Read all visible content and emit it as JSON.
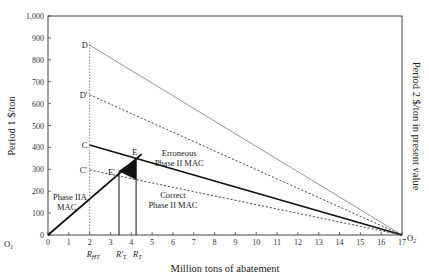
{
  "chart_data": {
    "type": "line",
    "title": "",
    "xlabel": "Million tons of abatement",
    "ylabel_left": "Period 1 $/ton",
    "ylabel_right": "Period 2 $/ton in present value",
    "xlim": [
      0,
      17
    ],
    "ylim": [
      0,
      1000
    ],
    "x_ticks": [
      "0",
      "1",
      "2",
      "3",
      "4",
      "5",
      "6",
      "7",
      "8",
      "9",
      "10",
      "11",
      "12",
      "13",
      "14",
      "15",
      "16",
      "17"
    ],
    "y_ticks": [
      "0",
      "100",
      "200",
      "300",
      "400",
      "500",
      "600",
      "700",
      "800",
      "900",
      "1,000"
    ],
    "grid": false,
    "origin_labels": {
      "left": "O1",
      "right": "O2"
    },
    "x_markers": [
      {
        "label": "R_HT",
        "x": 2.0
      },
      {
        "label": "R'_T",
        "x": 3.41
      },
      {
        "label": "R_T",
        "x": 4.23
      }
    ],
    "series": [
      {
        "name": "D line (Period 2 MAC, high)",
        "style": "solid-thin-gray",
        "points": [
          [
            2,
            867
          ],
          [
            17,
            0
          ]
        ]
      },
      {
        "name": "D' line",
        "style": "dotted",
        "points": [
          [
            2,
            640
          ],
          [
            17,
            0
          ]
        ]
      },
      {
        "name": "Erroneous Phase II MAC (C)",
        "style": "solid-thick",
        "points": [
          [
            2,
            411
          ],
          [
            17,
            0
          ]
        ]
      },
      {
        "name": "Correct Phase II MAC (C')",
        "style": "dotted",
        "points": [
          [
            2,
            297
          ],
          [
            17,
            0
          ]
        ]
      },
      {
        "name": "Phase II MAC",
        "style": "solid-thick",
        "points": [
          [
            0,
            0
          ],
          [
            4.5,
            369
          ]
        ]
      }
    ],
    "points": [
      {
        "label": "D",
        "x": 2,
        "y": 867
      },
      {
        "label": "D'",
        "x": 2,
        "y": 640
      },
      {
        "label": "C",
        "x": 2,
        "y": 411
      },
      {
        "label": "C'",
        "x": 2,
        "y": 297
      },
      {
        "label": "A",
        "x": 2,
        "y": 164
      },
      {
        "label": "E",
        "x": 4.23,
        "y": 347
      },
      {
        "label": "E'",
        "x": 3.41,
        "y": 292
      }
    ],
    "annotations": [
      {
        "text": "Phase II\nMAC",
        "x": 0.9,
        "y": 160
      },
      {
        "text": "Erroneous\nPhase II MAC",
        "x": 6.3,
        "y": 360
      },
      {
        "text": "Correct\nPhase II MAC",
        "x": 6.0,
        "y": 170
      }
    ],
    "shaded_region": {
      "vertices": [
        [
          3.41,
          292
        ],
        [
          4.23,
          347
        ],
        [
          4.23,
          253
        ]
      ],
      "fill": "#111111"
    }
  }
}
